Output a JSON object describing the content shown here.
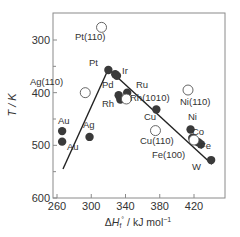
{
  "chart_data": {
    "type": "scatter",
    "title": "",
    "xlabel": "ΔH_f° / kJ mol⁻¹",
    "xlabel_parts": {
      "delta": "Δ",
      "H": "H",
      "sub": "f",
      "sup": "°",
      "unit": " / kJ mol",
      "unit_sup": "−1"
    },
    "ylabel": "T / K",
    "xlim": [
      255,
      445
    ],
    "ylim": [
      600,
      250
    ],
    "y_inverted": true,
    "x_ticks": [
      260,
      300,
      340,
      380,
      420
    ],
    "y_ticks": [
      300,
      400,
      500,
      600
    ],
    "x_minor_ticks": [],
    "y_minor_ticks": [
      350,
      450,
      550
    ],
    "grid": false,
    "legend": null,
    "series": [
      {
        "name": "polycrystalline / close-packed (filled)",
        "marker": "filled-circle",
        "color": "#333333",
        "points": [
          {
            "label": "Au",
            "x": 266,
            "y": 473
          },
          {
            "label": "Au",
            "x": 266,
            "y": 493
          },
          {
            "label": "Ag",
            "x": 298,
            "y": 484
          },
          {
            "label": "Pt",
            "x": 320,
            "y": 357
          },
          {
            "label": "Ir",
            "x": 328,
            "y": 365
          },
          {
            "label": "Pd",
            "x": 330,
            "y": 368
          },
          {
            "label": "Rh",
            "x": 332,
            "y": 405
          },
          {
            "label": "Rh",
            "x": 334,
            "y": 413
          },
          {
            "label": "Ru",
            "x": 342,
            "y": 400
          },
          {
            "label": "Cu",
            "x": 376,
            "y": 432
          },
          {
            "label": "Ni",
            "x": 416,
            "y": 470
          },
          {
            "label": "Co",
            "x": 418,
            "y": 486
          },
          {
            "label": "Fe",
            "x": 425,
            "y": 494
          },
          {
            "label": "Fe",
            "x": 428,
            "y": 498
          },
          {
            "label": "W",
            "x": 440,
            "y": 528
          }
        ]
      },
      {
        "name": "open crystal faces (hollow)",
        "marker": "open-circle",
        "color": "#333333",
        "points": [
          {
            "label": "Pt (110)",
            "x": 312,
            "y": 276
          },
          {
            "label": "Ag (110)",
            "x": 293,
            "y": 400
          },
          {
            "label": "Rh (1010)",
            "x": 341,
            "y": 412
          },
          {
            "label": "Ni (110)",
            "x": 413,
            "y": 395
          },
          {
            "label": "Cu (110)",
            "x": 375,
            "y": 472
          },
          {
            "label": "Fe (100)",
            "x": 420,
            "y": 490
          }
        ]
      }
    ],
    "trend_lines": [
      {
        "name": "ascending branch",
        "from": {
          "x": 267,
          "y": 545
        },
        "to": {
          "x": 320,
          "y": 355
        }
      },
      {
        "name": "descending branch",
        "from": {
          "x": 320,
          "y": 355
        },
        "to": {
          "x": 441,
          "y": 536
        }
      }
    ],
    "annotations": [
      "Pt (110)",
      "Ag (110)",
      "Pt",
      "Pd",
      "Ir",
      "Rh",
      "Ru",
      "Rh (1010)",
      "Ni (110)",
      "Cu",
      "Cu (110)",
      "Ni",
      "Co",
      "Fe",
      "Fe (100)",
      "W",
      "Au",
      "Au",
      "Ag"
    ]
  }
}
